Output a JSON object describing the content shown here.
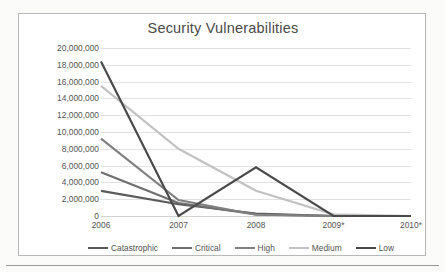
{
  "figure": {
    "border_color": "#b9b9b9",
    "background": "#ffffff"
  },
  "chart_data": {
    "type": "line",
    "title": "Security Vulnerabilities",
    "xlabel": "",
    "ylabel": "",
    "categories": [
      "2006",
      "2007",
      "2008",
      "2009*",
      "2010*"
    ],
    "ylim": [
      0,
      20000000
    ],
    "ytick_labels": [
      "20,000,000",
      "18,000,000",
      "16,000,000",
      "14,000,000",
      "12,000,000",
      "10,000,000",
      "8,000,000",
      "6,000,000",
      "4,000,000",
      "2,000,000",
      "0"
    ],
    "ytick_values": [
      20000000,
      18000000,
      16000000,
      14000000,
      12000000,
      10000000,
      8000000,
      6000000,
      4000000,
      2000000,
      0
    ],
    "ytick_step": 2000000,
    "grid": true,
    "grid_axis": "y",
    "legend_position": "bottom",
    "series": [
      {
        "name": "Catastrophic",
        "color": "#595959",
        "width": 2.2,
        "values": [
          3000000,
          1400000,
          300000,
          0,
          0
        ]
      },
      {
        "name": "Critical",
        "color": "#6e6e6e",
        "width": 2.2,
        "values": [
          5200000,
          1550000,
          200000,
          0,
          0
        ]
      },
      {
        "name": "High",
        "color": "#808080",
        "width": 2.2,
        "values": [
          9200000,
          1900000,
          150000,
          0,
          0
        ]
      },
      {
        "name": "Medium",
        "color": "#c2c2c2",
        "width": 2.2,
        "values": [
          15500000,
          8000000,
          3000000,
          200000,
          0
        ]
      },
      {
        "name": "Low",
        "color": "#4a4a4a",
        "width": 2.2,
        "values": [
          18400000,
          0,
          5800000,
          0,
          0
        ]
      }
    ]
  }
}
